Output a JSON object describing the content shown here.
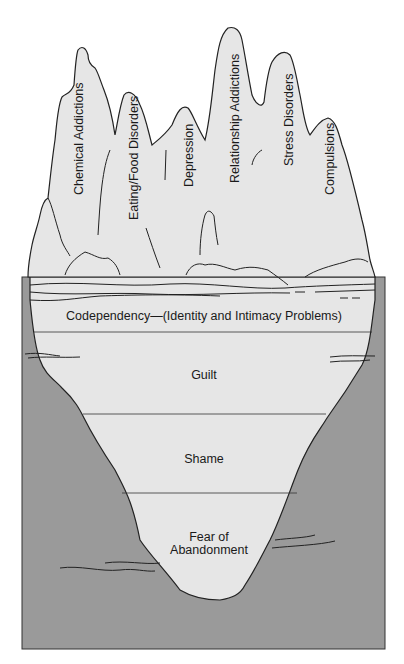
{
  "diagram": {
    "type": "iceberg",
    "colors": {
      "water": "#9a9a9a",
      "ice": "#e6e6e6",
      "outline": "#222222",
      "background": "#ffffff"
    },
    "above_water": {
      "peaks": [
        {
          "label": "Chemical Addictions"
        },
        {
          "label": "Eating/Food Disorders"
        },
        {
          "label": "Depression"
        },
        {
          "label": "Relationship Addictions"
        },
        {
          "label": "Stress Disorders"
        },
        {
          "label": "Compulsions"
        }
      ]
    },
    "below_water": {
      "layers": [
        {
          "label": "Codependency—(Identity and Intimacy Problems)"
        },
        {
          "label": "Guilt"
        },
        {
          "label": "Shame"
        },
        {
          "label_line1": "Fear of",
          "label_line2": "Abandonment"
        }
      ]
    }
  }
}
